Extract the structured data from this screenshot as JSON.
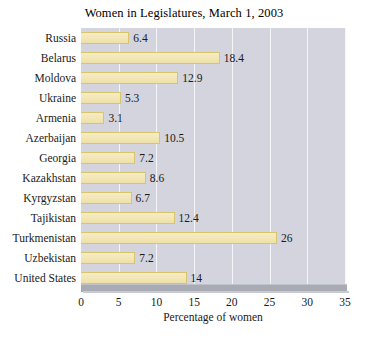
{
  "chart_data": {
    "type": "bar",
    "orientation": "horizontal",
    "title": "Women in Legislatures, March 1, 2003",
    "xlabel": "Percentage of women",
    "ylabel": "",
    "xlim": [
      0,
      35
    ],
    "xticks": [
      0,
      5,
      10,
      15,
      20,
      25,
      30,
      35
    ],
    "xtick_labels": [
      "0",
      "5",
      "10",
      "15",
      "20",
      "25",
      "30",
      "35"
    ],
    "grid": true,
    "legend": "none",
    "categories": [
      "Russia",
      "Belarus",
      "Moldova",
      "Ukraine",
      "Armenia",
      "Azerbaijan",
      "Georgia",
      "Kazakhstan",
      "Kyrgyzstan",
      "Tajikistan",
      "Turkmenistan",
      "Uzbekistan",
      "United States"
    ],
    "values": [
      6.4,
      18.4,
      12.9,
      5.3,
      3.1,
      10.5,
      7.2,
      8.6,
      6.7,
      12.4,
      26,
      7.2,
      14
    ],
    "value_labels": [
      "6.4",
      "18.4",
      "12.9",
      "5.3",
      "3.1",
      "10.5",
      "7.2",
      "8.6",
      "6.7",
      "12.4",
      "26",
      "7.2",
      "14"
    ],
    "colors": {
      "bar_fill": "#f2e7b8",
      "bar_border": "#d8c46b",
      "plot_background": "#d3d4dd",
      "gridline": "#f4f5f8",
      "text": "#1a1a1a",
      "page_background": "#ffffff"
    }
  }
}
